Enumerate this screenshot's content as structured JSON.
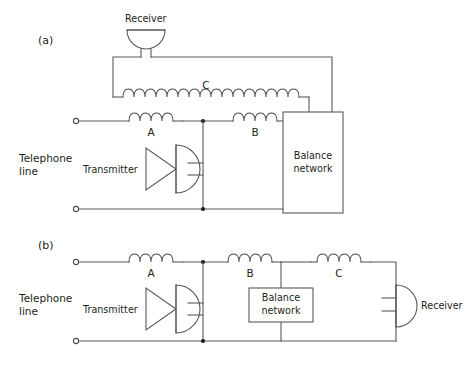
{
  "figure": {
    "background_color": "#ffffff",
    "line_color": "#58595b",
    "text_color": "#231f20"
  },
  "panels": [
    {
      "id": "a",
      "label": "(a)",
      "line_label_l1": "Telephone",
      "line_label_l2": "line",
      "components": {
        "receiver_label": "Receiver",
        "transmitter_label": "Transmitter",
        "balance_l1": "Balance",
        "balance_l2": "network"
      },
      "coils": [
        {
          "name": "A",
          "turns": 4
        },
        {
          "name": "B",
          "turns": 4
        },
        {
          "name": "C",
          "turns": 16
        }
      ]
    },
    {
      "id": "b",
      "label": "(b)",
      "line_label_l1": "Telephone",
      "line_label_l2": "line",
      "components": {
        "receiver_label": "Receiver",
        "transmitter_label": "Transmitter",
        "balance_l1": "Balance",
        "balance_l2": "network"
      },
      "coils": [
        {
          "name": "A",
          "turns": 4
        },
        {
          "name": "B",
          "turns": 4
        },
        {
          "name": "C",
          "turns": 4
        }
      ]
    }
  ]
}
